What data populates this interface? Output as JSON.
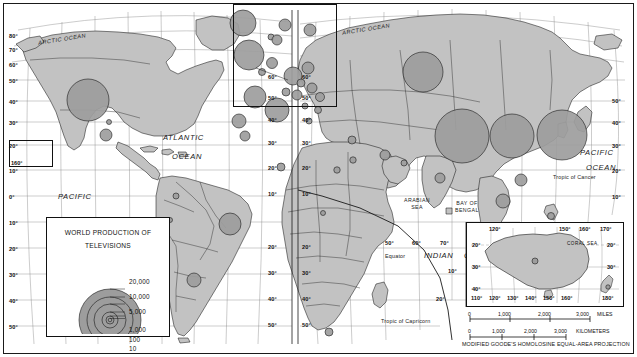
{
  "map": {
    "title_hidden": "World Production of Televisions thematic map",
    "projection_note": "MODIFIED GOODE'S HOMOLOSINE EQUAL-AREA PROJECTION",
    "land_color": "#bfbfbf",
    "circle_color": "#9a9a9a",
    "line_color": "#1a1a1a",
    "ocean_color": "#ffffff"
  },
  "legend": {
    "title_line1": "WORLD PRODUCTION OF",
    "title_line2": "TELEVISIONS",
    "values": [
      "20,000",
      "10,000",
      "5,000",
      "1,000",
      "100",
      "10"
    ]
  },
  "ocean_labels": [
    {
      "name": "arctic-ocean-west",
      "text": "ARCTIC OCEAN",
      "x": 38,
      "y": 36
    },
    {
      "name": "arctic-ocean-east",
      "text": "ARCTIC OCEAN",
      "x": 342,
      "y": 26
    },
    {
      "name": "atlantic-ocean",
      "text": "ATLANTIC",
      "x": 163,
      "y": 133
    },
    {
      "name": "atlantic-ocean-2",
      "text": "OCEAN",
      "x": 172,
      "y": 152
    },
    {
      "name": "pacific-ocean-west",
      "text": "PACIFIC",
      "x": 58,
      "y": 192
    },
    {
      "name": "pacific-ocean-west-2",
      "text": "OCEAN",
      "x": 58,
      "y": 226
    },
    {
      "name": "pacific-ocean-east",
      "text": "PACIFIC",
      "x": 580,
      "y": 148
    },
    {
      "name": "pacific-ocean-east-2",
      "text": "OCEAN",
      "x": 586,
      "y": 163
    },
    {
      "name": "indian-ocean",
      "text": "INDIAN",
      "x": 424,
      "y": 251
    },
    {
      "name": "indian-ocean-2",
      "text": "OCEAN",
      "x": 464,
      "y": 251
    }
  ],
  "sea_labels": [
    {
      "name": "arabian-sea",
      "text": "ARABIAN\nSEA",
      "x": 404,
      "y": 197
    },
    {
      "name": "bay-of-bengal",
      "text": "BAY OF\nBENGAL",
      "x": 455,
      "y": 200
    },
    {
      "name": "coral-sea",
      "text": "CORAL   SEA",
      "x": 566,
      "y": 288
    }
  ],
  "tropics": [
    {
      "name": "tropic-of-cancer",
      "text": "Tropic of Cancer",
      "x": 553,
      "y": 174
    },
    {
      "name": "tropic-of-capricorn",
      "text": "Tropic of Capricorn",
      "x": 381,
      "y": 318
    },
    {
      "name": "equator",
      "text": "Equator",
      "x": 385,
      "y": 253
    }
  ],
  "graticule_labels_left": [
    "80°",
    "70°",
    "60°",
    "50°",
    "40°",
    "30°",
    "20°",
    "10°",
    "0°",
    "10°",
    "20°",
    "30°",
    "40°",
    "50°"
  ],
  "graticule_labels_center": [
    "60°",
    "50°",
    "40°",
    "30°",
    "20°",
    "10°",
    "20°",
    "30°",
    "40°",
    "50°"
  ],
  "graticule_labels_right": [
    "50°",
    "40°",
    "30°",
    "20°",
    "10°"
  ],
  "longitude_labels": [
    "50°",
    "60°",
    "70°",
    "80°",
    "90°",
    "140°",
    "150°"
  ],
  "hawaii_inset": {
    "label": "160°"
  },
  "australia_inset": {
    "top_labels": [
      "120°",
      "150°",
      "160°",
      "170°"
    ],
    "left_labels": [
      "20°",
      "30°",
      "40°"
    ],
    "right_labels": [
      "20°",
      "30°"
    ],
    "bottom_labels": [
      "110°",
      "120°",
      "130°",
      "140°",
      "150°",
      "160°",
      "180°"
    ]
  },
  "scale_miles": {
    "ticks": [
      "0",
      "1,000",
      "2,000",
      "3,000"
    ],
    "unit": "MILES"
  },
  "scale_km": {
    "ticks": [
      "0",
      "1,000",
      "2,000",
      "3,000"
    ],
    "unit": "KILOMETERS"
  },
  "chart_data": {
    "type": "map",
    "title": "WORLD PRODUCTION OF TELEVISIONS",
    "symbol": "proportional-circle",
    "units": "televisions produced (thousands of units implied by legend classes)",
    "legend_breaks": [
      20000,
      10000,
      5000,
      1000,
      100,
      10
    ],
    "points": [
      {
        "name": "United States",
        "x": 88,
        "y": 100,
        "r": 21,
        "class": 20000
      },
      {
        "name": "Mexico",
        "x": 106,
        "y": 135,
        "r": 6,
        "class": 1000
      },
      {
        "name": "Canada-small",
        "x": 109,
        "y": 122,
        "r": 2.5,
        "class": 100
      },
      {
        "name": "Brazil",
        "x": 230,
        "y": 224,
        "r": 11,
        "class": 5000
      },
      {
        "name": "Colombia",
        "x": 176,
        "y": 196,
        "r": 3,
        "class": 100
      },
      {
        "name": "Peru",
        "x": 170,
        "y": 220,
        "r": 2.5,
        "class": 100
      },
      {
        "name": "Argentina",
        "x": 194,
        "y": 280,
        "r": 7,
        "class": 1000
      },
      {
        "name": "United Kingdom",
        "x": 249,
        "y": 55,
        "r": 15,
        "class": 10000
      },
      {
        "name": "Ireland",
        "x": 243,
        "y": 23,
        "r": 13,
        "class": 10000
      },
      {
        "name": "Sweden",
        "x": 285,
        "y": 25,
        "r": 6,
        "class": 1000
      },
      {
        "name": "Norway",
        "x": 271,
        "y": 37,
        "r": 3,
        "class": 100
      },
      {
        "name": "Finland",
        "x": 310,
        "y": 30,
        "r": 6,
        "class": 1000
      },
      {
        "name": "Denmark",
        "x": 277,
        "y": 40,
        "r": 5,
        "class": 1000
      },
      {
        "name": "Netherlands",
        "x": 272,
        "y": 63,
        "r": 5.5,
        "class": 1000
      },
      {
        "name": "Belgium",
        "x": 262,
        "y": 72,
        "r": 3.5,
        "class": 100
      },
      {
        "name": "Germany",
        "x": 293,
        "y": 76,
        "r": 9,
        "class": 5000
      },
      {
        "name": "Poland",
        "x": 308,
        "y": 68,
        "r": 6,
        "class": 1000
      },
      {
        "name": "France",
        "x": 255,
        "y": 97,
        "r": 11,
        "class": 5000
      },
      {
        "name": "Spain",
        "x": 239,
        "y": 121,
        "r": 7,
        "class": 1000
      },
      {
        "name": "Portugal",
        "x": 245,
        "y": 136,
        "r": 5,
        "class": 1000
      },
      {
        "name": "Italy",
        "x": 277,
        "y": 110,
        "r": 12,
        "class": 10000
      },
      {
        "name": "Austria",
        "x": 297,
        "y": 95,
        "r": 5,
        "class": 1000
      },
      {
        "name": "Switzerland",
        "x": 286,
        "y": 92,
        "r": 4,
        "class": 1000
      },
      {
        "name": "Czech",
        "x": 301,
        "y": 83,
        "r": 4,
        "class": 1000
      },
      {
        "name": "Hungary",
        "x": 312,
        "y": 88,
        "r": 5,
        "class": 1000
      },
      {
        "name": "Romania",
        "x": 320,
        "y": 97,
        "r": 4.5,
        "class": 1000
      },
      {
        "name": "Bulgaria",
        "x": 318,
        "y": 110,
        "r": 3.5,
        "class": 100
      },
      {
        "name": "Greece",
        "x": 309,
        "y": 121,
        "r": 3,
        "class": 100
      },
      {
        "name": "Yugoslavia",
        "x": 305,
        "y": 106,
        "r": 3,
        "class": 100
      },
      {
        "name": "Turkey",
        "x": 352,
        "y": 140,
        "r": 4,
        "class": 1000
      },
      {
        "name": "Russia",
        "x": 423,
        "y": 72,
        "r": 20,
        "class": 20000
      },
      {
        "name": "Egypt",
        "x": 353,
        "y": 160,
        "r": 3.2,
        "class": 100
      },
      {
        "name": "Morocco",
        "x": 281,
        "y": 167,
        "r": 4,
        "class": 1000
      },
      {
        "name": "Algeria",
        "x": 337,
        "y": 170,
        "r": 3.2,
        "class": 100
      },
      {
        "name": "Nigeria",
        "x": 323,
        "y": 213,
        "r": 2.5,
        "class": 100
      },
      {
        "name": "South Africa",
        "x": 329,
        "y": 332,
        "r": 4,
        "class": 1000
      },
      {
        "name": "Iran",
        "x": 385,
        "y": 155,
        "r": 5,
        "class": 1000
      },
      {
        "name": "Pakistan",
        "x": 404,
        "y": 163,
        "r": 3,
        "class": 100
      },
      {
        "name": "India",
        "x": 440,
        "y": 178,
        "r": 5,
        "class": 1000
      },
      {
        "name": "China",
        "x": 462,
        "y": 136,
        "r": 27,
        "class": 20000
      },
      {
        "name": "Korea",
        "x": 512,
        "y": 136,
        "r": 22,
        "class": 20000
      },
      {
        "name": "Japan",
        "x": 562,
        "y": 135,
        "r": 25,
        "class": 20000
      },
      {
        "name": "Taiwan",
        "x": 521,
        "y": 180,
        "r": 6,
        "class": 1000
      },
      {
        "name": "Hong Kong",
        "x": 503,
        "y": 201,
        "r": 7,
        "class": 1000
      },
      {
        "name": "Philippines",
        "x": 551,
        "y": 216,
        "r": 3.5,
        "class": 100
      },
      {
        "name": "Thailand",
        "x": 516,
        "y": 233,
        "r": 7.5,
        "class": 1000
      },
      {
        "name": "Malaysia",
        "x": 511,
        "y": 260,
        "r": 8,
        "class": 5000
      },
      {
        "name": "Singapore",
        "x": 549,
        "y": 261,
        "r": 4.5,
        "class": 1000
      },
      {
        "name": "Australia",
        "x": 528,
        "y": 264,
        "r": 3,
        "class": 100
      },
      {
        "name": "New Zealand",
        "x": 594,
        "y": 292,
        "r": 2.5,
        "class": 10
      }
    ]
  }
}
